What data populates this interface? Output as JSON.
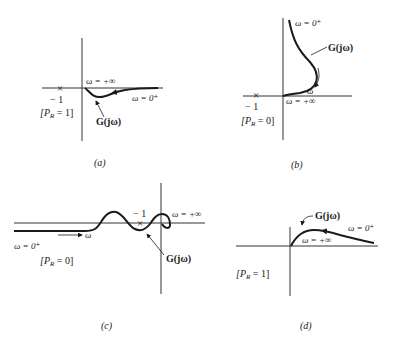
{
  "figure": {
    "panels": [
      {
        "id": "a",
        "caption": "(a)",
        "minus_one": "− 1",
        "point_marker": "×",
        "omega_inf": "ω = +∞",
        "omega_zero": "ω = 0⁺",
        "g_label": "G(jω)",
        "pr_label": "[P",
        "pr_sub": "R",
        "pr_value": " = 1]"
      },
      {
        "id": "b",
        "caption": "(b)",
        "minus_one": "− 1",
        "point_marker": "×",
        "omega_zero": "ω = 0⁺",
        "omega_inf": "ω = +∞",
        "omega_dir": "ω",
        "g_label": "G(jω)",
        "pr_label": "[P",
        "pr_sub": "R",
        "pr_value": " = 0]"
      },
      {
        "id": "c",
        "caption": "(c)",
        "minus_one": "− 1",
        "point_marker": "×",
        "omega_zero": "ω = 0⁺",
        "omega_inf": "ω = +∞",
        "omega_dir": "ω",
        "g_label": "G(jω)",
        "pr_label": "[P",
        "pr_sub": "R",
        "pr_value": " = 0]"
      },
      {
        "id": "d",
        "caption": "(d)",
        "omega_zero": "ω = 0⁺",
        "omega_inf": "ω = +∞",
        "g_label": "G(jω)",
        "pr_label": "[P",
        "pr_sub": "R",
        "pr_value": " = 1]"
      }
    ],
    "colors": {
      "ink": "#1a1a1a",
      "axis": "#333333",
      "background": "#ffffff"
    }
  }
}
